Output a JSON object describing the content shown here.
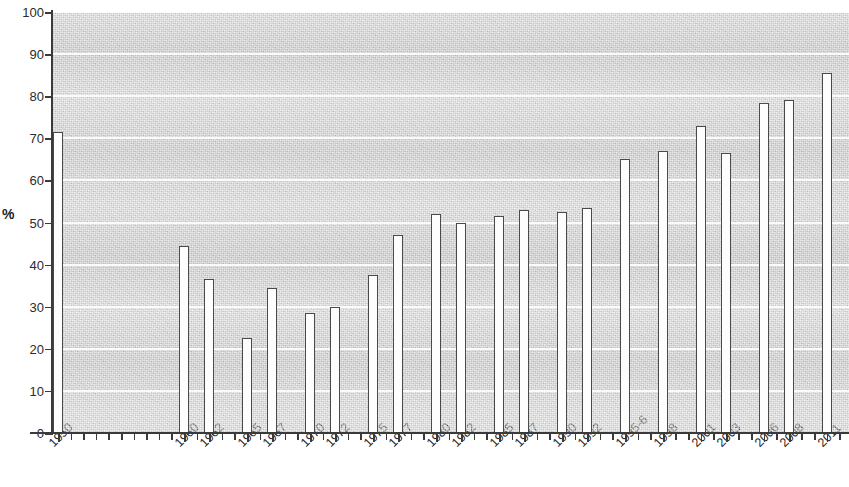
{
  "chart_data": {
    "type": "bar",
    "title": "",
    "subtitle": "",
    "xlabel": "",
    "ylabel": "%",
    "ylim": [
      0,
      100
    ],
    "xlim_note": "categorical year slots, gap between 1950 and 1960",
    "grid": true,
    "gridlines_every": 10,
    "legend": "none",
    "y_ticks": [
      0,
      10,
      20,
      30,
      40,
      50,
      60,
      70,
      80,
      90,
      100
    ],
    "y_tick_labels": [
      "0",
      "10",
      "20",
      "30",
      "40",
      "50",
      "60",
      "70",
      "80",
      "90",
      "100"
    ],
    "categories": [
      "1950",
      "1960",
      "1962",
      "1965",
      "1967",
      "1970",
      "1972",
      "1975",
      "1977",
      "1980",
      "1982",
      "1985",
      "1987",
      "1990",
      "1992",
      "1995-6",
      "1998",
      "2001",
      "2003",
      "2006",
      "2008",
      "2011"
    ],
    "values": [
      71.5,
      44.5,
      36.5,
      22.5,
      34.5,
      28.5,
      30,
      37.5,
      47,
      52,
      50,
      51.5,
      53,
      52.5,
      53.5,
      65,
      67,
      73,
      66.5,
      78.5,
      79,
      85.5
    ],
    "bars": [
      {
        "label": "1950",
        "value": 71.5,
        "slot": 0
      },
      {
        "label": "1960",
        "value": 44.5,
        "slot": 10
      },
      {
        "label": "1962",
        "value": 36.5,
        "slot": 12
      },
      {
        "label": "1965",
        "value": 22.5,
        "slot": 15
      },
      {
        "label": "1967",
        "value": 34.5,
        "slot": 17
      },
      {
        "label": "1970",
        "value": 28.5,
        "slot": 20
      },
      {
        "label": "1972",
        "value": 30.0,
        "slot": 22
      },
      {
        "label": "1975",
        "value": 37.5,
        "slot": 25
      },
      {
        "label": "1977",
        "value": 47.0,
        "slot": 27
      },
      {
        "label": "1980",
        "value": 52.0,
        "slot": 30
      },
      {
        "label": "1982",
        "value": 50.0,
        "slot": 32
      },
      {
        "label": "1985",
        "value": 51.5,
        "slot": 35
      },
      {
        "label": "1987",
        "value": 53.0,
        "slot": 37
      },
      {
        "label": "1990",
        "value": 52.5,
        "slot": 40
      },
      {
        "label": "1992",
        "value": 53.5,
        "slot": 42
      },
      {
        "label": "1995-6",
        "value": 65.0,
        "slot": 45
      },
      {
        "label": "1998",
        "value": 67.0,
        "slot": 48
      },
      {
        "label": "2001",
        "value": 73.0,
        "slot": 51
      },
      {
        "label": "2003",
        "value": 66.5,
        "slot": 53
      },
      {
        "label": "2006",
        "value": 78.5,
        "slot": 56
      },
      {
        "label": "2008",
        "value": 79.0,
        "slot": 58
      },
      {
        "label": "2011",
        "value": 85.5,
        "slot": 61
      }
    ],
    "colors": {
      "bar_fill": "#fdfdfd",
      "bar_outline": "#4a4a4a",
      "plot_background": "#d9d9d9",
      "gridline": "#ffffff",
      "axis": "#3a3a3a",
      "text": "#262626"
    }
  }
}
